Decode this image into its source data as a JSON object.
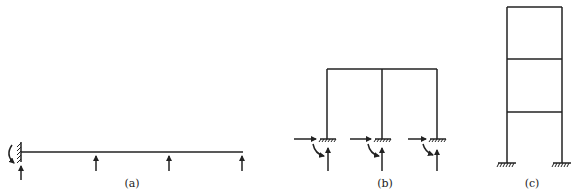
{
  "figures": [
    {
      "id": "a",
      "caption": "(a)",
      "description": "Cantilever beam fixed at left with vertical reaction arrows at intermediate points and free end"
    },
    {
      "id": "b",
      "caption": "(b)",
      "description": "Single-storey two-bay frame with fixed supports showing horizontal, vertical and moment reactions"
    },
    {
      "id": "c",
      "caption": "(c)",
      "description": "Three-storey single-bay frame with fixed supports"
    }
  ],
  "colors": {
    "line": "#222222",
    "background": "#ffffff"
  }
}
